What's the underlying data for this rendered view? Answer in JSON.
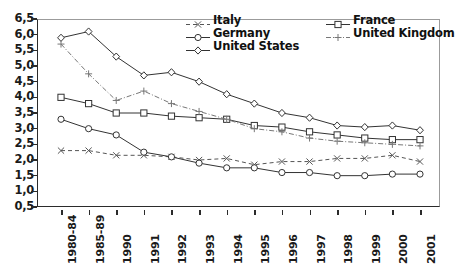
{
  "chart_data": {
    "type": "line",
    "title": "",
    "subtitle": "",
    "xlabel": "",
    "ylabel": "",
    "ylim": [
      0.5,
      6.5
    ],
    "ytick_step": 0.5,
    "grid": false,
    "decimal_separator": ",",
    "legend_position": "top-center",
    "categories": [
      "1980-84",
      "1985-89",
      "1990",
      "1991",
      "1992",
      "1993",
      "1994",
      "1995",
      "1996",
      "1997",
      "1998",
      "1999",
      "2000",
      "2001"
    ],
    "ytick_labels": [
      "6,5",
      "6,0",
      "5,5",
      "5,0",
      "4,5",
      "4,0",
      "3,5",
      "3,0",
      "2,5",
      "2,0",
      "1,5",
      "1,0",
      "0,5"
    ],
    "ytick_values": [
      6.5,
      6.0,
      5.5,
      5.0,
      4.5,
      4.0,
      3.5,
      3.0,
      2.5,
      2.0,
      1.5,
      1.0,
      0.5
    ],
    "series": [
      {
        "name": "Italy",
        "marker": "x",
        "dash": "4,3",
        "color": "#555555",
        "values": [
          2.3,
          2.3,
          2.15,
          2.15,
          2.1,
          2.0,
          2.05,
          1.85,
          1.95,
          1.95,
          2.05,
          2.05,
          2.15,
          1.95
        ]
      },
      {
        "name": "Germany",
        "marker": "circle",
        "dash": "none",
        "color": "#333333",
        "values": [
          3.3,
          3.0,
          2.8,
          2.25,
          2.1,
          1.9,
          1.75,
          1.75,
          1.6,
          1.6,
          1.5,
          1.5,
          1.55,
          1.55
        ]
      },
      {
        "name": "United States",
        "marker": "diamond",
        "dash": "none",
        "color": "#333333",
        "values": [
          5.9,
          6.1,
          5.3,
          4.7,
          4.8,
          4.5,
          4.1,
          3.8,
          3.5,
          3.35,
          3.1,
          3.05,
          3.1,
          2.95
        ]
      },
      {
        "name": "France",
        "marker": "square",
        "dash": "none",
        "color": "#333333",
        "values": [
          4.0,
          3.8,
          3.5,
          3.5,
          3.4,
          3.35,
          3.3,
          3.1,
          3.05,
          2.9,
          2.8,
          2.7,
          2.65,
          2.65
        ]
      },
      {
        "name": "United Kingdom",
        "marker": "plus",
        "dash": "5,2,1,2",
        "color": "#777777",
        "values": [
          5.7,
          4.75,
          3.9,
          4.2,
          3.8,
          3.55,
          3.3,
          3.0,
          2.9,
          2.7,
          2.6,
          2.55,
          2.5,
          2.45
        ]
      }
    ]
  },
  "legend": {
    "columns": [
      {
        "items": [
          "Italy",
          "Germany",
          "United States"
        ]
      },
      {
        "items": [
          "France",
          "United Kingdom"
        ]
      }
    ]
  }
}
